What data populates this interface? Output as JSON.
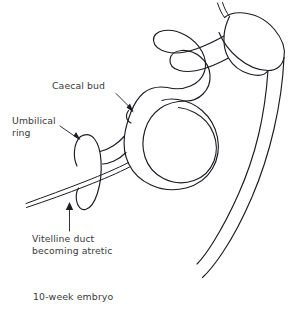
{
  "figure": {
    "background_color": "#ffffff",
    "line_color": "#1c1c22",
    "text_color": "#3a3a40"
  },
  "labels": {
    "caecal_bud": "Caecal bud",
    "umbilical_ring_line1": "Umbilical",
    "umbilical_ring_line2": "ring",
    "vitelline_duct_line1": "Vitelline duct",
    "vitelline_duct_line2": "becoming atretic"
  },
  "caption": {
    "embryo_age": "10-week embryo"
  },
  "anatomy": {
    "parts": [
      "oesophagus",
      "stomach",
      "duodenal-loop",
      "midgut-loop",
      "caecal-bud",
      "umbilical-ring",
      "vitelline-duct",
      "hindgut"
    ]
  }
}
